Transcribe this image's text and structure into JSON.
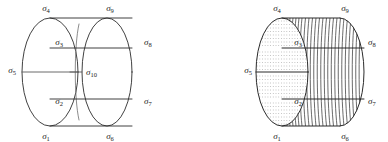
{
  "figure": {
    "stroke_color": "#2b2b2b",
    "hatch_color": "#555555",
    "dot_color": "#808080",
    "background": "#ffffff",
    "panels": [
      {
        "name": "left-panel-outline-cylinder",
        "style": "outline",
        "labels": [
          {
            "id": "s4",
            "base": "σ",
            "sub": "4",
            "x": 46,
            "y": 11,
            "anchor": "middle"
          },
          {
            "id": "s9",
            "base": "σ",
            "sub": "9",
            "x": 110,
            "y": 11,
            "anchor": "middle"
          },
          {
            "id": "s3",
            "base": "σ",
            "sub": "3",
            "x": 63,
            "y": 45,
            "anchor": "end"
          },
          {
            "id": "s8",
            "base": "σ",
            "sub": "8",
            "x": 144,
            "y": 45,
            "anchor": "start"
          },
          {
            "id": "s5",
            "base": "σ",
            "sub": "5",
            "x": 16,
            "y": 73,
            "anchor": "end"
          },
          {
            "id": "s10",
            "base": "σ",
            "sub": "10",
            "x": 86,
            "y": 74,
            "anchor": "start"
          },
          {
            "id": "s2",
            "base": "σ",
            "sub": "2",
            "x": 63,
            "y": 104,
            "anchor": "end"
          },
          {
            "id": "s7",
            "base": "σ",
            "sub": "7",
            "x": 144,
            "y": 104,
            "anchor": "start"
          },
          {
            "id": "s1",
            "base": "σ",
            "sub": "1",
            "x": 46,
            "y": 137,
            "anchor": "middle"
          },
          {
            "id": "s6",
            "base": "σ",
            "sub": "6",
            "x": 110,
            "y": 137,
            "anchor": "middle"
          }
        ]
      },
      {
        "name": "right-panel-shaded-cylinder",
        "style": "shaded",
        "labels": [
          {
            "id": "s4",
            "base": "σ",
            "sub": "4",
            "x": 277,
            "y": 11,
            "anchor": "middle"
          },
          {
            "id": "s9",
            "base": "σ",
            "sub": "9",
            "x": 345,
            "y": 11,
            "anchor": "middle"
          },
          {
            "id": "s3",
            "base": "σ",
            "sub": "3",
            "x": 300,
            "y": 45,
            "anchor": "end"
          },
          {
            "id": "s8",
            "base": "σ",
            "sub": "8",
            "x": 366,
            "y": 45,
            "anchor": "start"
          },
          {
            "id": "s5",
            "base": "σ",
            "sub": "5",
            "x": 252,
            "y": 73,
            "anchor": "end"
          },
          {
            "id": "s2",
            "base": "σ",
            "sub": "2",
            "x": 300,
            "y": 104,
            "anchor": "end"
          },
          {
            "id": "s7",
            "base": "σ",
            "sub": "7",
            "x": 366,
            "y": 104,
            "anchor": "start"
          },
          {
            "id": "s1",
            "base": "σ",
            "sub": "1",
            "x": 277,
            "y": 137,
            "anchor": "middle"
          },
          {
            "id": "s6",
            "base": "σ",
            "sub": "6",
            "x": 345,
            "y": 137,
            "anchor": "middle"
          }
        ]
      }
    ],
    "geometry": {
      "left": {
        "front_ellipse_cx": 50,
        "front_ellipse_cy": 72,
        "front_rx": 28,
        "front_ry": 54,
        "back_ellipse_cx": 107,
        "back_ellipse_cy": 72,
        "back_rx": 25,
        "back_ry": 54,
        "top_y": 18,
        "bottom_y": 126,
        "chord_top_y": 48,
        "chord_bottom_y": 99
      },
      "right": {
        "front_ellipse_cx": 282,
        "front_ellipse_cy": 72,
        "front_rx": 26,
        "front_ry": 54,
        "back_ellipse_cx": 340,
        "back_ellipse_cy": 72,
        "back_rx": 24,
        "back_ry": 54,
        "top_y": 18,
        "bottom_y": 126,
        "chord_top_y": 48,
        "chord_bottom_y": 99,
        "meridian_count": 22,
        "dot_row_count": 30
      }
    }
  }
}
